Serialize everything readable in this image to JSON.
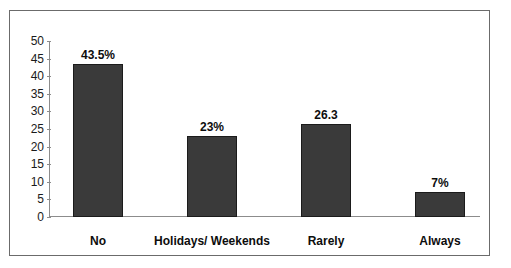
{
  "chart_data": {
    "type": "bar",
    "title": "",
    "xlabel": "",
    "ylabel": "",
    "categories": [
      "No",
      "Holidays/ Weekends",
      "Rarely",
      "Always"
    ],
    "values": [
      43.5,
      23,
      26.3,
      7
    ],
    "data_labels": [
      "43.5%",
      "23%",
      "26.3",
      "7%"
    ],
    "ylim": [
      0,
      50
    ],
    "ytick_step": 5,
    "yticks": [
      0,
      5,
      10,
      15,
      20,
      25,
      30,
      35,
      40,
      45,
      50
    ],
    "ytick_labels": [
      "0",
      "5",
      "10",
      "15",
      "20",
      "25",
      "30",
      "35",
      "40",
      "45",
      "50"
    ],
    "grid": false,
    "legend": false,
    "series": [
      {
        "name": "",
        "values": [
          43.5,
          23,
          26.3,
          7
        ]
      }
    ],
    "colors": {
      "bar_fill": "#3a3a3a",
      "bar_border": "#1b1b1b",
      "axis": "#8c8c8c",
      "frame_border": "#6b6b6b",
      "text": "#0d0d0d",
      "background": "#ffffff"
    }
  }
}
